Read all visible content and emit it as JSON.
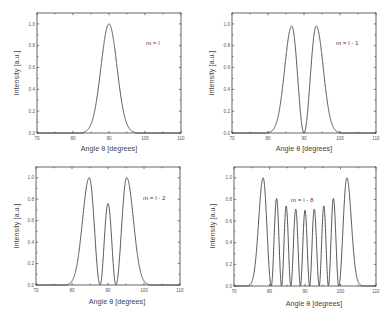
{
  "chart_data": [
    {
      "type": "line",
      "panel": "top-left",
      "title": "",
      "annotation": "m = l",
      "xlabel": "Angle θ [degrees]",
      "ylabel": "Intensity [a.u.]",
      "xlim": [
        70,
        110
      ],
      "ylim": [
        0,
        1.1
      ],
      "xticks": [
        "70",
        "80",
        "90",
        "100",
        "110"
      ],
      "yticks": [
        "0.0",
        "0.2",
        "0.4",
        "0.6",
        "0.8",
        "1.0"
      ],
      "grid": false,
      "legend": null,
      "peaks": [
        {
          "x": 90.0,
          "y": 1.0
        }
      ],
      "zeros": [],
      "support": [
        82.5,
        97.5
      ]
    },
    {
      "type": "line",
      "panel": "top-right",
      "title": "",
      "annotation": "m = l - 1",
      "xlabel": "Angle θ [degrees]",
      "ylabel": "Intensity [a.u.]",
      "xlim": [
        70,
        110
      ],
      "ylim": [
        0,
        1.1
      ],
      "xticks": [
        "70",
        "80",
        "90",
        "100",
        "110"
      ],
      "yticks": [
        "0.0",
        "0.2",
        "0.4",
        "0.6",
        "0.8",
        "1.0"
      ],
      "grid": false,
      "legend": null,
      "peaks": [
        {
          "x": 86.6,
          "y": 0.98
        },
        {
          "x": 93.4,
          "y": 0.98
        }
      ],
      "zeros": [
        90.0
      ],
      "support": [
        80.0,
        100.0
      ]
    },
    {
      "type": "line",
      "panel": "bottom-left",
      "title": "",
      "annotation": "m = l - 2",
      "xlabel": "Angle θ [degrees]",
      "ylabel": "Intensity [a.u.]",
      "xlim": [
        70,
        110
      ],
      "ylim": [
        0,
        1.1
      ],
      "xticks": [
        "70",
        "80",
        "90",
        "100",
        "110"
      ],
      "yticks": [
        "0.0",
        "0.2",
        "0.4",
        "0.6",
        "0.8",
        "1.0"
      ],
      "grid": false,
      "legend": null,
      "peaks": [
        {
          "x": 84.8,
          "y": 1.0
        },
        {
          "x": 90.0,
          "y": 0.76
        },
        {
          "x": 95.2,
          "y": 1.0
        }
      ],
      "zeros": [
        87.8,
        92.2
      ],
      "support": [
        78.5,
        101.5
      ]
    },
    {
      "type": "line",
      "panel": "bottom-right",
      "title": "",
      "annotation": "m = l - 8",
      "xlabel": "Angle θ [degrees]",
      "ylabel": "Intensity [a.u.]",
      "xlim": [
        70,
        110
      ],
      "ylim": [
        0,
        1.1
      ],
      "xticks": [
        "70",
        "80",
        "90",
        "100",
        "110"
      ],
      "yticks": [
        "0.0",
        "0.2",
        "0.4",
        "0.6",
        "0.8",
        "1.0"
      ],
      "grid": false,
      "legend": null,
      "peaks": [
        {
          "x": 78.2,
          "y": 1.0
        },
        {
          "x": 82.0,
          "y": 0.81
        },
        {
          "x": 84.7,
          "y": 0.74
        },
        {
          "x": 87.4,
          "y": 0.71
        },
        {
          "x": 90.0,
          "y": 0.7
        },
        {
          "x": 92.6,
          "y": 0.71
        },
        {
          "x": 95.3,
          "y": 0.74
        },
        {
          "x": 98.0,
          "y": 0.81
        },
        {
          "x": 101.8,
          "y": 1.0
        }
      ],
      "zeros": [
        80.5,
        83.4,
        86.0,
        88.7,
        91.3,
        94.0,
        96.6,
        99.5
      ],
      "support": [
        74.0,
        106.0
      ]
    }
  ],
  "figure": {
    "panels": [
      {
        "annotation": "m = l",
        "xlabel": "Angle θ [degrees]",
        "ylabel": "Intensity [a.u.]"
      },
      {
        "annotation": "m = l - 1",
        "xlabel": "Angle θ [degrees]",
        "ylabel": "Intensity [a.u.]"
      },
      {
        "annotation": "m = l - 2",
        "xlabel": "Angle θ [degrees]",
        "ylabel": "Intensity [a.u.]"
      },
      {
        "annotation": "m = l - 8",
        "xlabel": "Angle θ [degrees]",
        "ylabel": "Intensity [a.u.]"
      }
    ]
  },
  "colors": {
    "axis": "#555555",
    "curve": "#444444",
    "background": "#ffffff"
  }
}
